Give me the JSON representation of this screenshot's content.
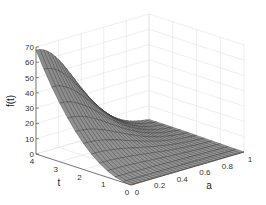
{
  "chart_data": {
    "type": "surface3d",
    "title": "",
    "xlabel": "a",
    "ylabel": "t",
    "zlabel": "f(t)",
    "x_ticks": [
      "0",
      "0.2",
      "0.4",
      "0.6",
      "0.8",
      "1"
    ],
    "y_ticks": [
      "0",
      "1",
      "2",
      "3",
      "4"
    ],
    "z_ticks": [
      "0",
      "10",
      "20",
      "30",
      "40",
      "50",
      "60",
      "70"
    ],
    "xlim": [
      0,
      1
    ],
    "ylim": [
      0,
      4
    ],
    "zlim": [
      0,
      70
    ],
    "grid": true,
    "sample_points": [
      {
        "a": 0,
        "t": 4,
        "f": 68
      },
      {
        "a": 0,
        "t": 3,
        "f": 50
      },
      {
        "a": 0,
        "t": 2,
        "f": 25
      },
      {
        "a": 0,
        "t": 1,
        "f": 8
      },
      {
        "a": 0,
        "t": 0,
        "f": 0
      },
      {
        "a": 0.5,
        "t": 4,
        "f": 17
      },
      {
        "a": 1,
        "t": 4,
        "f": 2
      },
      {
        "a": 1,
        "t": 0,
        "f": 0
      }
    ]
  },
  "axes": {
    "z_label": "f(t)",
    "t_label": "t",
    "a_label": "a",
    "z_ticks": [
      "0",
      "10",
      "20",
      "30",
      "40",
      "50",
      "60",
      "70"
    ],
    "t_ticks": [
      "4",
      "3",
      "2",
      "1",
      "0"
    ],
    "a_ticks": [
      "0",
      "0.2",
      "0.4",
      "0.6",
      "0.8",
      "1"
    ]
  }
}
